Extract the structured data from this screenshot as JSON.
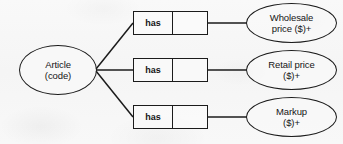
{
  "diagram": {
    "type": "orm-fact-type-diagram",
    "colors": {
      "stroke": "#1b1b1b",
      "text": "#151515",
      "background": "#f7f7f7"
    },
    "entity": {
      "name": "Article",
      "line1": "Article",
      "line2": "(code)",
      "reference_mode": "(code)"
    },
    "facts": [
      {
        "predicate_label": "has",
        "second_role_label": "",
        "value_type_line1": "Wholesale",
        "value_type_line2": "price ($)+"
      },
      {
        "predicate_label": "has",
        "second_role_label": "",
        "value_type_line1": "Retail price",
        "value_type_line2": "($)+"
      },
      {
        "predicate_label": "has",
        "second_role_label": "",
        "value_type_line1": "Markup",
        "value_type_line2": "($)+"
      }
    ]
  }
}
